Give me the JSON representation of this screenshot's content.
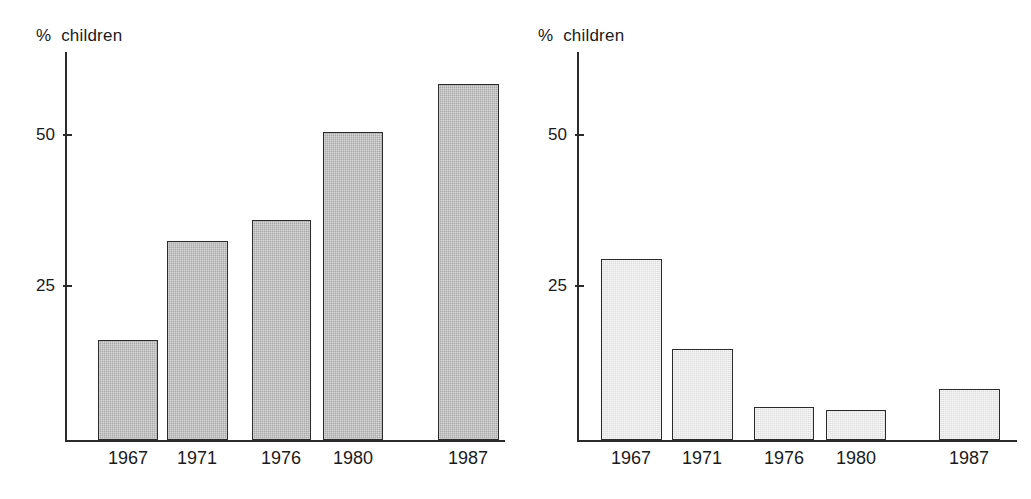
{
  "chart_data": [
    {
      "type": "bar",
      "title": "",
      "subtitle": "",
      "ylabel": "% children",
      "xlabel": "",
      "categories": [
        "1967",
        "1971",
        "1976",
        "1980",
        "1987"
      ],
      "values": [
        16.5,
        33,
        36.5,
        51,
        59
      ],
      "series": [
        {
          "name": "% children",
          "values": [
            16.5,
            33,
            36.5,
            51,
            59
          ]
        }
      ],
      "ytick_labels": [
        "25",
        "50"
      ],
      "ytick_values": [
        25,
        50
      ],
      "ylim": [
        0,
        63
      ],
      "grid": false,
      "legend": "none",
      "bar_fill": "#a9a9a9",
      "bar_stroke": "#2b2b2b",
      "panel": "left"
    },
    {
      "type": "bar",
      "title": "",
      "subtitle": "",
      "ylabel": "% children",
      "xlabel": "",
      "categories": [
        "1967",
        "1971",
        "1976",
        "1980",
        "1987"
      ],
      "values": [
        30,
        15,
        5.5,
        5,
        8.5
      ],
      "series": [
        {
          "name": "% children",
          "values": [
            30,
            15,
            5.5,
            5,
            8.5
          ]
        }
      ],
      "ytick_labels": [
        "25",
        "50"
      ],
      "ytick_values": [
        25,
        50
      ],
      "ylim": [
        0,
        63
      ],
      "grid": false,
      "legend": "none",
      "bar_fill": "#dedede",
      "bar_stroke": "#2b2b2b",
      "panel": "right"
    }
  ],
  "left_chart": {
    "axis_title": "%  children",
    "ticks": [
      {
        "label": "50"
      },
      {
        "label": "25"
      }
    ],
    "bars": [
      {
        "label": "1967",
        "value": 16.5
      },
      {
        "label": "1971",
        "value": 33
      },
      {
        "label": "1976",
        "value": 36.5
      },
      {
        "label": "1980",
        "value": 51
      },
      {
        "label": "1987",
        "value": 59
      }
    ]
  },
  "right_chart": {
    "axis_title": "%  children",
    "ticks": [
      {
        "label": "50"
      },
      {
        "label": "25"
      }
    ],
    "bars": [
      {
        "label": "1967",
        "value": 30
      },
      {
        "label": "1971",
        "value": 15
      },
      {
        "label": "1976",
        "value": 5.5
      },
      {
        "label": "1980",
        "value": 5
      },
      {
        "label": "1987",
        "value": 8.5
      }
    ]
  }
}
